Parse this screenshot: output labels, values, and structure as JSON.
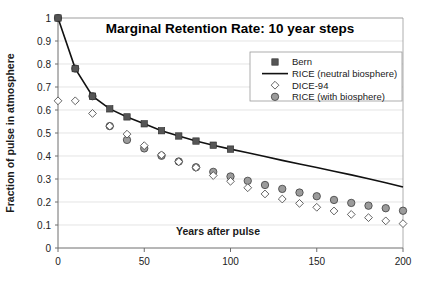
{
  "chart_data": {
    "type": "scatter",
    "title": "Marginal Retention Rate: 10 year steps",
    "xlabel": "Years after pulse",
    "ylabel": "Fraction of pulse in atmosphere",
    "xlim": [
      0,
      200
    ],
    "ylim": [
      0,
      1
    ],
    "xticks": [
      0,
      50,
      100,
      150,
      200
    ],
    "xtick_labels": [
      "0",
      "50",
      "100",
      "150",
      "200"
    ],
    "yticks": [
      0,
      0.1,
      0.2,
      0.3,
      0.4,
      0.5,
      0.6,
      0.7,
      0.8,
      0.9,
      1
    ],
    "ytick_labels": [
      "0",
      "0.1",
      "0.2",
      "0.3",
      "0.4",
      "0.5",
      "0.6",
      "0.7",
      "0.8",
      "0.9",
      "1"
    ],
    "grid": "horizontal",
    "legend_position": "top-right",
    "series": [
      {
        "name": "Bern",
        "marker": "filled-square",
        "color": "#555555",
        "x": [
          0,
          10,
          20,
          30,
          40,
          50,
          60,
          70,
          80,
          90,
          100
        ],
        "y": [
          1.0,
          0.78,
          0.66,
          0.605,
          0.57,
          0.54,
          0.51,
          0.487,
          0.465,
          0.447,
          0.43
        ]
      },
      {
        "name": "RICE (neutral biosphere)",
        "marker": "line",
        "color": "#111111",
        "x": [
          0,
          10,
          20,
          30,
          40,
          50,
          60,
          70,
          80,
          90,
          100,
          110,
          120,
          130,
          140,
          150,
          160,
          170,
          180,
          190,
          200
        ],
        "y": [
          1.0,
          0.78,
          0.66,
          0.605,
          0.57,
          0.54,
          0.51,
          0.487,
          0.465,
          0.447,
          0.43,
          0.414,
          0.398,
          0.381,
          0.365,
          0.35,
          0.334,
          0.318,
          0.301,
          0.284,
          0.265
        ]
      },
      {
        "name": "DICE-94",
        "marker": "open-diamond",
        "color": "#ffffff",
        "x": [
          0,
          10,
          20,
          30,
          40,
          50,
          60,
          70,
          80,
          90,
          100,
          110,
          120,
          130,
          140,
          150,
          160,
          170,
          180,
          190,
          200
        ],
        "y": [
          0.64,
          0.64,
          0.585,
          0.53,
          0.495,
          0.445,
          0.405,
          0.375,
          0.35,
          0.315,
          0.29,
          0.262,
          0.235,
          0.213,
          0.194,
          0.177,
          0.161,
          0.146,
          0.132,
          0.118,
          0.106
        ]
      },
      {
        "name": "RICE (with biosphere)",
        "marker": "filled-circle",
        "color": "#9b9b9b",
        "x": [
          0,
          10,
          20,
          30,
          40,
          50,
          60,
          70,
          80,
          90,
          100,
          110,
          120,
          130,
          140,
          150,
          160,
          170,
          180,
          190,
          200
        ],
        "y": [
          1.0,
          0.78,
          0.66,
          0.53,
          0.47,
          0.433,
          0.401,
          0.376,
          0.351,
          0.331,
          0.311,
          0.292,
          0.274,
          0.257,
          0.241,
          0.225,
          0.209,
          0.196,
          0.184,
          0.173,
          0.162
        ]
      }
    ]
  },
  "legend": {
    "items": [
      {
        "label": "Bern",
        "marker": "filled-square"
      },
      {
        "label": "RICE (neutral biosphere)",
        "marker": "line"
      },
      {
        "label": "DICE-94",
        "marker": "open-diamond"
      },
      {
        "label": "RICE (with biosphere)",
        "marker": "filled-circle"
      }
    ]
  }
}
